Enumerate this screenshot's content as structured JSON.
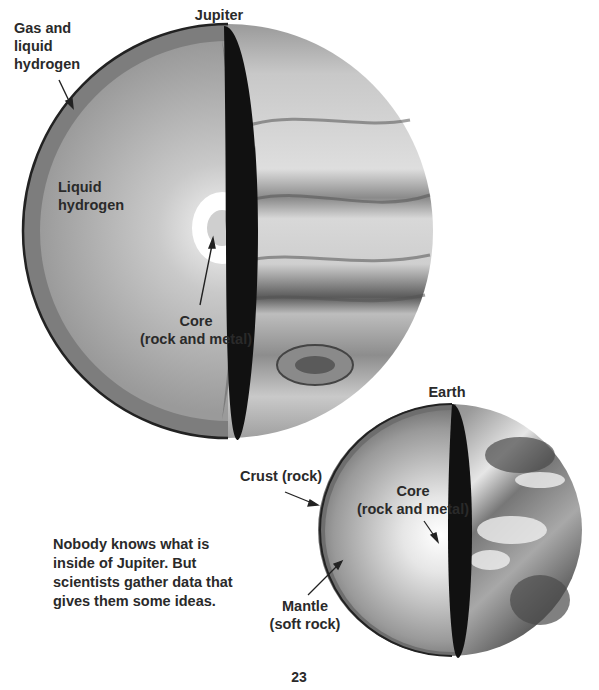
{
  "page": {
    "page_number": "23",
    "caption": [
      "Nobody knows what is",
      "inside of Jupiter. But",
      "scientists gather data that",
      "gives them some ideas."
    ]
  },
  "jupiter": {
    "title": "Jupiter",
    "labels": {
      "outer_layer": [
        "Gas and",
        "liquid",
        "hydrogen"
      ],
      "middle_layer": [
        "Liquid",
        "hydrogen"
      ],
      "core": [
        "Core",
        "(rock and metal)"
      ]
    }
  },
  "earth": {
    "title": "Earth",
    "labels": {
      "crust": "Crust (rock)",
      "core": [
        "Core",
        "(rock and metal)"
      ],
      "mantle": [
        "Mantle",
        "(soft rock)"
      ]
    }
  },
  "colors": {
    "text": "#2a2a2a",
    "outline": "#111111",
    "outer_shell": "#7d7d7d",
    "inner_fill": "#a9a9a9",
    "core_glow": "#ffffff"
  }
}
